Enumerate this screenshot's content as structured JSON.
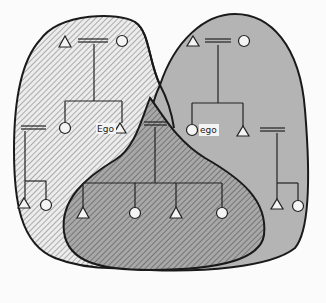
{
  "diagram": {
    "type": "kinship-overlap",
    "colors": {
      "background": "#fbfbfb",
      "left_group_fill": "#e6e6e6",
      "right_group_fill": "#b8b8b8",
      "center_group_fill": "#9e9e9e",
      "outline": "#1a1a1a",
      "hatch": "#555555"
    },
    "labels": {
      "left_ego": "Ego",
      "right_ego": "ego"
    },
    "groups": [
      {
        "id": "left",
        "style": "hatched-light",
        "description": "Kindred of Ego (left)"
      },
      {
        "id": "right",
        "style": "solid-grey",
        "description": "Kindred of ego (right)"
      },
      {
        "id": "center",
        "style": "hatched-dark",
        "description": "Overlap: nuclear family of Ego and ego"
      }
    ],
    "symbols": {
      "triangle": "male",
      "circle": "female",
      "double-line": "marriage"
    }
  }
}
